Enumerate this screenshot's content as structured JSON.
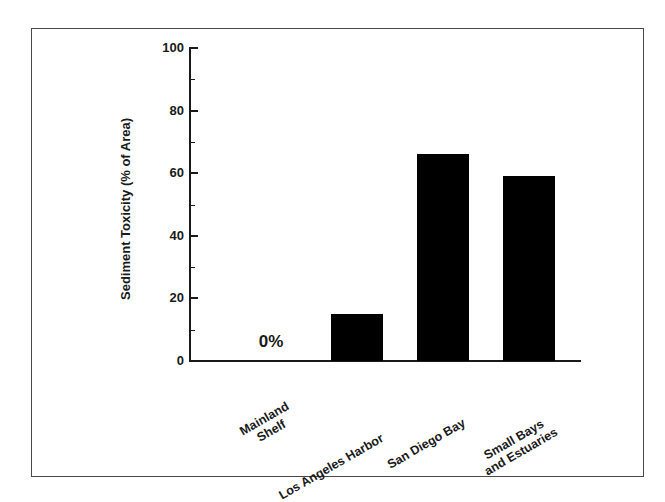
{
  "figure": {
    "background_color": "#ffffff",
    "frame_color": "#4a4a4a",
    "bar_color": "#000000",
    "axis_color": "#1a1a1a"
  },
  "chart_data": {
    "type": "bar",
    "title": "",
    "subtitle": "",
    "xlabel": "",
    "ylabel": "Sediment Toxicity (% of Area)",
    "categories": [
      "Mainland Shelf",
      "Los Angeles Harbor",
      "San Diego Bay",
      "Small Bays and Estuaries"
    ],
    "category_lines": [
      [
        "Mainland",
        "Shelf"
      ],
      [
        "Los Angeles Harbor"
      ],
      [
        "San Diego Bay"
      ],
      [
        "Small Bays",
        "and Estuaries"
      ]
    ],
    "values": [
      0,
      15,
      66,
      59
    ],
    "ylim": [
      0,
      100
    ],
    "y_major_ticks": [
      0,
      20,
      40,
      60,
      80,
      100
    ],
    "y_minor_ticks": [
      10,
      30,
      50,
      70,
      90
    ],
    "y_tick_labels": [
      "0",
      "20",
      "40",
      "60",
      "80",
      "100"
    ],
    "grid": false,
    "legend": false,
    "legend_position": "none",
    "annotations": [
      {
        "text": "0%",
        "category": "Mainland Shelf",
        "value": 0
      }
    ]
  }
}
